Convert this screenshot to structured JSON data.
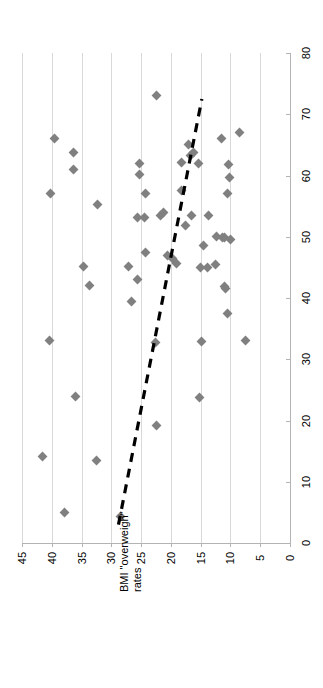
{
  "chart_data": {
    "type": "scatter",
    "title": "",
    "orientation": "rotated-90-ccw",
    "xlabel": "BMI \"overweigh\" rates",
    "ylabel": "",
    "xlim": [
      45,
      0
    ],
    "ylim": [
      0,
      80
    ],
    "x_ticks": [
      45,
      40,
      35,
      30,
      25,
      20,
      15,
      10,
      5,
      0
    ],
    "y_ticks": [
      0,
      10,
      20,
      30,
      40,
      50,
      60,
      70,
      80
    ],
    "grid": "x-gridlines-only",
    "legend": "none",
    "marker_shape": "diamond",
    "marker_color": "#808080",
    "gridline_color": "#D9D9D9",
    "axis_color": "#B3B3B3",
    "trendline": {
      "style": "dashed",
      "color": "#000000",
      "x_start": 28.8,
      "y_start": 3.0,
      "x_end": 14.8,
      "y_end": 72.5
    },
    "points": [
      {
        "x": 22.4,
        "y": 73.0
      },
      {
        "x": 39.5,
        "y": 66.0
      },
      {
        "x": 36.3,
        "y": 63.7
      },
      {
        "x": 36.4,
        "y": 61.0
      },
      {
        "x": 25.2,
        "y": 62.0
      },
      {
        "x": 25.3,
        "y": 60.2
      },
      {
        "x": 40.2,
        "y": 57.0
      },
      {
        "x": 17.0,
        "y": 65.0
      },
      {
        "x": 16.7,
        "y": 63.3
      },
      {
        "x": 16.2,
        "y": 63.8
      },
      {
        "x": 18.2,
        "y": 62.2
      },
      {
        "x": 15.3,
        "y": 62.0
      },
      {
        "x": 11.5,
        "y": 66.0
      },
      {
        "x": 8.5,
        "y": 67.0
      },
      {
        "x": 10.4,
        "y": 61.8
      },
      {
        "x": 10.2,
        "y": 59.6
      },
      {
        "x": 32.3,
        "y": 55.3
      },
      {
        "x": 24.2,
        "y": 57.0
      },
      {
        "x": 18.3,
        "y": 57.5
      },
      {
        "x": 10.5,
        "y": 57.0
      },
      {
        "x": 25.6,
        "y": 53.2
      },
      {
        "x": 24.5,
        "y": 53.2
      },
      {
        "x": 21.8,
        "y": 53.5
      },
      {
        "x": 21.2,
        "y": 53.9
      },
      {
        "x": 16.5,
        "y": 53.5
      },
      {
        "x": 13.7,
        "y": 53.4
      },
      {
        "x": 17.5,
        "y": 51.8
      },
      {
        "x": 12.3,
        "y": 50.0
      },
      {
        "x": 11.3,
        "y": 49.9
      },
      {
        "x": 11.0,
        "y": 49.8
      },
      {
        "x": 10.0,
        "y": 49.6
      },
      {
        "x": 14.5,
        "y": 48.5
      },
      {
        "x": 24.3,
        "y": 47.4
      },
      {
        "x": 20.5,
        "y": 46.9
      },
      {
        "x": 19.8,
        "y": 46.4
      },
      {
        "x": 19.0,
        "y": 45.6
      },
      {
        "x": 12.5,
        "y": 45.5
      },
      {
        "x": 34.7,
        "y": 45.2
      },
      {
        "x": 27.2,
        "y": 45.2
      },
      {
        "x": 15.0,
        "y": 45.0
      },
      {
        "x": 13.9,
        "y": 45.0
      },
      {
        "x": 25.6,
        "y": 43.0
      },
      {
        "x": 33.7,
        "y": 42.0
      },
      {
        "x": 11.0,
        "y": 41.8
      },
      {
        "x": 10.8,
        "y": 41.5
      },
      {
        "x": 26.6,
        "y": 39.5
      },
      {
        "x": 10.5,
        "y": 37.5
      },
      {
        "x": 40.3,
        "y": 33.0
      },
      {
        "x": 22.6,
        "y": 32.8
      },
      {
        "x": 14.8,
        "y": 32.9
      },
      {
        "x": 7.5,
        "y": 33.0
      },
      {
        "x": 36.0,
        "y": 24.0
      },
      {
        "x": 15.2,
        "y": 23.8
      },
      {
        "x": 22.5,
        "y": 19.2
      },
      {
        "x": 41.5,
        "y": 14.2
      },
      {
        "x": 32.5,
        "y": 13.5
      },
      {
        "x": 37.8,
        "y": 5.0
      },
      {
        "x": 28.5,
        "y": 4.3
      }
    ]
  }
}
